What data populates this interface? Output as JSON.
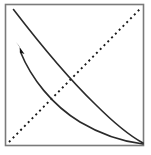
{
  "figure": {
    "canvas": {
      "width": 151,
      "height": 155,
      "background": "#ffffff"
    }
  },
  "frame": {
    "name": "plot-border",
    "x": 5.5,
    "y": 4.5,
    "width": 138,
    "height": 141,
    "stroke": "#7a7a7a",
    "stroke_width": 1.6,
    "fill": "none"
  },
  "diagonal": {
    "name": "forty-five-degree-line",
    "label": "45-degree reference line",
    "x1": 9,
    "y1": 142,
    "x2": 141,
    "y2": 8,
    "stroke": "#1a1a1a",
    "stroke_width": 1.9,
    "dash_array": "2 3.4",
    "linecap": "butt"
  },
  "curves": [
    {
      "name": "outer-curve",
      "label": "Original curve",
      "path": "M 13.5 9.5 C 40 44, 66 76, 95 104 C 112 121, 130 136, 143 143",
      "stroke": "#2a2a2a",
      "stroke_width": 1.6,
      "fill": "none"
    },
    {
      "name": "inner-curve",
      "label": "Shifted curve",
      "path": "M 20.5 52 C 31 78, 52 105, 80 122 C 102 135, 126 142, 143 144",
      "stroke": "#2a2a2a",
      "stroke_width": 1.6,
      "fill": "none"
    }
  ],
  "arrow": {
    "name": "shift-arrow",
    "label": "Direction of shift",
    "points": "16,42 24.5,54 20,52.5 19.5,46.5",
    "fill": "#111111",
    "tip_x": 16,
    "tip_y": 42
  },
  "corners": {
    "top_left": [
      5,
      4
    ],
    "top_right": [
      143,
      4
    ],
    "bottom_left": [
      5,
      145
    ],
    "bottom_right": [
      143,
      145
    ]
  }
}
